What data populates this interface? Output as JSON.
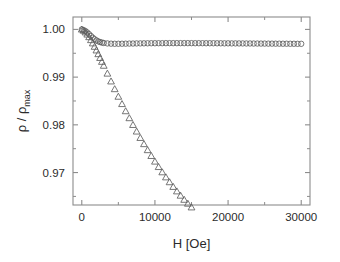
{
  "figure": {
    "background_color": "#ffffff",
    "frame_color": "#8c8c8c",
    "marker_color": "#5f5f5f"
  },
  "chart_data": {
    "type": "scatter",
    "title": "",
    "subtitle": "",
    "xlabel": "H [Oe]",
    "ylabel": "ρ / ρ",
    "ylabel_subscript": "max",
    "xlim": [
      -1200,
      31200
    ],
    "ylim": [
      0.9632,
      1.0026
    ],
    "grid": false,
    "legend": "none",
    "xticks": [
      0,
      10000,
      20000,
      30000
    ],
    "xtick_labels": [
      "0",
      "10000",
      "20000",
      "30000"
    ],
    "xticks_minor": [
      5000,
      15000,
      25000
    ],
    "yticks": [
      0.97,
      0.98,
      0.99,
      1.0
    ],
    "ytick_labels": [
      "0.97",
      "0.98",
      "0.99",
      "1.00"
    ],
    "yticks_minor": [
      0.965,
      0.975,
      0.985,
      0.995
    ],
    "series": [
      {
        "name": "upper-branch",
        "marker": "circle",
        "filled": false,
        "x": [
          0,
          250,
          500,
          750,
          1000,
          1250,
          1500,
          1750,
          2000,
          2250,
          2500,
          2750,
          3000,
          3500,
          4000,
          4500,
          5000,
          5500,
          6000,
          6500,
          7000,
          7500,
          8000,
          8500,
          9000,
          9500,
          10000,
          10500,
          11000,
          11500,
          12000,
          12500,
          13000,
          13500,
          14000,
          14500,
          15000,
          15500,
          16000,
          16500,
          17000,
          17500,
          18000,
          18500,
          19000,
          19500,
          20000,
          20500,
          21000,
          21500,
          22000,
          22500,
          23000,
          23500,
          24000,
          24500,
          25000,
          25500,
          26000,
          26500,
          27000,
          27500,
          28000,
          28500,
          29000,
          29500,
          30000
        ],
        "y": [
          1.0,
          0.99985,
          0.99965,
          0.99935,
          0.999,
          0.99862,
          0.99826,
          0.99795,
          0.9977,
          0.9975,
          0.99735,
          0.99724,
          0.99716,
          0.99706,
          0.99701,
          0.99699,
          0.99699,
          0.997,
          0.99701,
          0.99703,
          0.99704,
          0.99706,
          0.99707,
          0.99708,
          0.99709,
          0.9971,
          0.9971,
          0.99711,
          0.99711,
          0.99712,
          0.99712,
          0.99712,
          0.99712,
          0.99712,
          0.99712,
          0.99712,
          0.99712,
          0.99711,
          0.99711,
          0.99711,
          0.9971,
          0.9971,
          0.9971,
          0.99709,
          0.99709,
          0.99708,
          0.99708,
          0.99707,
          0.99707,
          0.99706,
          0.99706,
          0.99705,
          0.99705,
          0.99704,
          0.99704,
          0.99703,
          0.99703,
          0.99702,
          0.99702,
          0.99701,
          0.99701,
          0.997,
          0.997,
          0.99699,
          0.99699,
          0.99698,
          0.99698
        ]
      },
      {
        "name": "lower-branch",
        "marker": "triangle-up",
        "filled": false,
        "x": [
          0,
          250,
          500,
          750,
          1000,
          1250,
          1500,
          1750,
          2000,
          2250,
          2500,
          2750,
          3000,
          3500,
          4000,
          4500,
          5000,
          5500,
          6000,
          6500,
          7000,
          7500,
          8000,
          8500,
          9000,
          9500,
          10000,
          10500,
          11000,
          11500,
          12000,
          12500,
          13000,
          13500,
          14000,
          14500,
          15000,
          15500,
          16000,
          16500,
          17000,
          17500,
          18000,
          18500,
          19000,
          19500,
          20000,
          20500,
          21000,
          21500,
          22000,
          22500,
          23000,
          23500,
          24000,
          24500,
          25000,
          25500,
          26000,
          26500,
          27000,
          27500,
          28000,
          28500,
          29000,
          29500,
          30000
        ],
        "y": [
          1.0,
          0.99975,
          0.9994,
          0.99895,
          0.9984,
          0.99778,
          0.9971,
          0.99638,
          0.99562,
          0.99484,
          0.99404,
          0.99323,
          0.99241,
          0.99076,
          0.98912,
          0.9875,
          0.98592,
          0.98438,
          0.98288,
          0.98142,
          0.98,
          0.97862,
          0.97728,
          0.97598,
          0.97472,
          0.9735,
          0.97232,
          0.97118,
          0.97008,
          0.96902,
          0.968,
          0.96702,
          0.96608,
          0.96518,
          0.96432,
          0.9635,
          0.96272,
          0.96198,
          0.96128,
          0.96062,
          0.96,
          0.95942,
          0.95888,
          0.95838,
          0.95792,
          0.9575,
          0.95712,
          0.95678,
          0.95648,
          0.95622,
          0.956,
          0.95582,
          0.95568,
          0.95558,
          0.95552,
          0.9555,
          0.95552,
          0.95558,
          0.95568,
          0.95582,
          0.956,
          0.95622,
          0.95648,
          0.95678,
          0.95712,
          0.9575,
          0.95792
        ]
      }
    ]
  }
}
